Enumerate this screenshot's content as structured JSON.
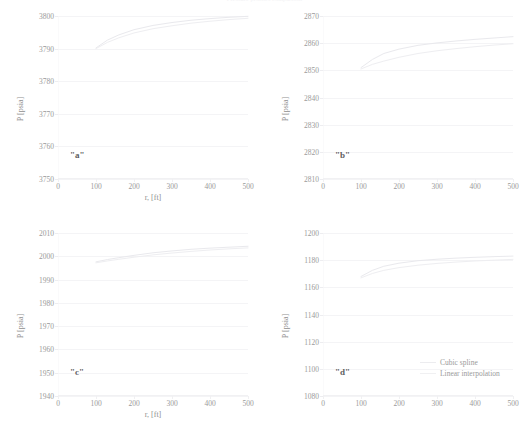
{
  "figure": {
    "title": "Pressure profiles comparison",
    "series_colors": {
      "cubic_spline": "#e9e9ed",
      "linear_interpolation": "#eeeef1",
      "grid": "#f4f4f6",
      "text": "#9a9a9a"
    },
    "legend": {
      "items": [
        {
          "label": "Cubic spline",
          "key": "spline"
        },
        {
          "label": "Linear interpolation",
          "key": "linear"
        }
      ]
    },
    "shared": {
      "xlabel": "r, [ft]",
      "ylabel": "P [psia]",
      "xticks": [
        "0",
        "100",
        "200",
        "300",
        "400",
        "500"
      ]
    }
  },
  "chart_data": [
    {
      "type": "line",
      "id": "a",
      "tag": "\"a\"",
      "title": "",
      "xlabel": "r, [ft]",
      "ylabel": "P [psia]",
      "xlim": [
        0,
        500
      ],
      "ylim": [
        3750,
        3800
      ],
      "xticks": [
        0,
        100,
        200,
        300,
        400,
        500
      ],
      "yticks": [
        3750,
        3760,
        3770,
        3780,
        3790,
        3800
      ],
      "ytick_labels": [
        "3750",
        "3760",
        "3770",
        "3780",
        "3790",
        "3800"
      ],
      "grid": true,
      "legend_position": "none",
      "series": [
        {
          "name": "Cubic spline",
          "x": [
            100,
            130,
            160,
            200,
            250,
            300,
            350,
            400,
            450,
            500
          ],
          "values": [
            3790.2,
            3792.6,
            3794.2,
            3795.8,
            3797.1,
            3798.0,
            3798.7,
            3799.2,
            3799.6,
            3799.9
          ]
        },
        {
          "name": "Linear interpolation",
          "x": [
            100,
            130,
            160,
            200,
            250,
            300,
            350,
            400,
            450,
            500
          ],
          "values": [
            3790.0,
            3791.9,
            3793.3,
            3794.8,
            3796.1,
            3797.0,
            3797.8,
            3798.4,
            3798.9,
            3799.3
          ]
        }
      ]
    },
    {
      "type": "line",
      "id": "b",
      "tag": "\"b\"",
      "title": "",
      "xlabel": "r, [ft]",
      "ylabel": "P [psia]",
      "xlim": [
        0,
        500
      ],
      "ylim": [
        2810,
        2870
      ],
      "xticks": [
        0,
        100,
        200,
        300,
        400,
        500
      ],
      "yticks": [
        2810,
        2820,
        2830,
        2840,
        2850,
        2860,
        2870
      ],
      "ytick_labels": [
        "2810",
        "2820",
        "2830",
        "2840",
        "2850",
        "2860",
        "2870"
      ],
      "grid": true,
      "legend_position": "none",
      "series": [
        {
          "name": "Cubic spline",
          "x": [
            100,
            130,
            160,
            200,
            250,
            300,
            350,
            400,
            450,
            500
          ],
          "values": [
            2851.0,
            2854.0,
            2856.2,
            2857.8,
            2859.2,
            2860.1,
            2860.8,
            2861.4,
            2861.9,
            2862.4
          ]
        },
        {
          "name": "Linear interpolation",
          "x": [
            100,
            130,
            160,
            200,
            250,
            300,
            350,
            400,
            450,
            500
          ],
          "values": [
            2850.5,
            2852.2,
            2853.4,
            2854.8,
            2856.2,
            2857.2,
            2858.0,
            2858.7,
            2859.3,
            2859.8
          ]
        }
      ]
    },
    {
      "type": "line",
      "id": "c",
      "tag": "\"c\"",
      "title": "",
      "xlabel": "r, [ft]",
      "ylabel": "P [psia]",
      "xlim": [
        0,
        500
      ],
      "ylim": [
        1940,
        2010
      ],
      "xticks": [
        0,
        100,
        200,
        300,
        400,
        500
      ],
      "yticks": [
        1940,
        1950,
        1960,
        1970,
        1980,
        1990,
        2000,
        2010
      ],
      "ytick_labels": [
        "1940",
        "1950",
        "1960",
        "1970",
        "1980",
        "1990",
        "2000",
        "2010"
      ],
      "grid": true,
      "legend_position": "none",
      "series": [
        {
          "name": "Cubic spline",
          "x": [
            100,
            130,
            160,
            200,
            250,
            300,
            350,
            400,
            450,
            500
          ],
          "values": [
            1997.6,
            1998.6,
            1999.4,
            2000.4,
            2001.5,
            2002.3,
            2003.0,
            2003.5,
            2003.9,
            2004.3
          ]
        },
        {
          "name": "Linear interpolation",
          "x": [
            100,
            130,
            160,
            200,
            250,
            300,
            350,
            400,
            450,
            500
          ],
          "values": [
            1997.2,
            1998.0,
            1998.7,
            1999.6,
            2000.6,
            2001.4,
            2002.1,
            2002.7,
            2003.2,
            2003.6
          ]
        }
      ]
    },
    {
      "type": "line",
      "id": "d",
      "tag": "\"d\"",
      "title": "",
      "xlabel": "r, [ft]",
      "ylabel": "P [psia]",
      "xlim": [
        0,
        500
      ],
      "ylim": [
        1080,
        1200
      ],
      "xticks": [
        0,
        100,
        200,
        300,
        400,
        500
      ],
      "yticks": [
        1080,
        1100,
        1120,
        1140,
        1160,
        1180,
        1200
      ],
      "ytick_labels": [
        "1080",
        "1100",
        "1120",
        "1140",
        "1160",
        "1180",
        "1200"
      ],
      "grid": true,
      "legend_position": "lower-right",
      "series": [
        {
          "name": "Cubic spline",
          "x": [
            100,
            130,
            160,
            200,
            250,
            300,
            350,
            400,
            450,
            500
          ],
          "values": [
            1168.0,
            1172.5,
            1175.5,
            1177.8,
            1179.6,
            1180.7,
            1181.5,
            1182.1,
            1182.6,
            1183.0
          ]
        },
        {
          "name": "Linear interpolation",
          "x": [
            100,
            130,
            160,
            200,
            250,
            300,
            350,
            400,
            450,
            500
          ],
          "values": [
            1167.0,
            1170.2,
            1172.5,
            1174.5,
            1176.3,
            1177.6,
            1178.6,
            1179.4,
            1180.0,
            1180.6
          ]
        }
      ]
    }
  ]
}
